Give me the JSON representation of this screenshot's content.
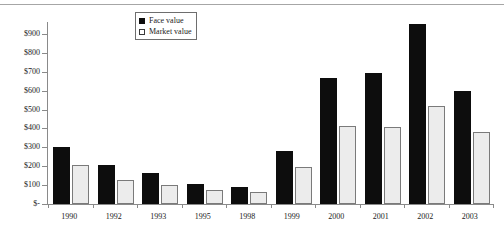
{
  "chart_data": {
    "type": "bar",
    "title": "",
    "subtitle": "",
    "xlabel": "",
    "ylabel": "",
    "categories": [
      "1990",
      "1992",
      "1993",
      "1995",
      "1998",
      "1999",
      "2000",
      "2001",
      "2002",
      "2003"
    ],
    "series": [
      {
        "name": "Face value",
        "color": "#0d0d0d",
        "values": [
          300,
          205,
          165,
          105,
          88,
          280,
          665,
          695,
          950,
          600
        ]
      },
      {
        "name": "Market value",
        "color": "#ececec",
        "values": [
          205,
          128,
          100,
          72,
          65,
          195,
          415,
          405,
          520,
          380
        ]
      }
    ],
    "ylim": [
      0,
      950
    ],
    "y_ticks": [
      0,
      100,
      200,
      300,
      400,
      500,
      600,
      700,
      800,
      900
    ],
    "y_tick_labels": [
      "$-",
      "$100",
      "$200",
      "$300",
      "$400",
      "$500",
      "$600",
      "$700",
      "$800",
      "$900"
    ],
    "grid": false,
    "legend_position": "top-center",
    "legend_entries": [
      "Face value",
      "Market value"
    ]
  },
  "legend": {
    "face_label": "Face value",
    "market_label": "Market value"
  }
}
